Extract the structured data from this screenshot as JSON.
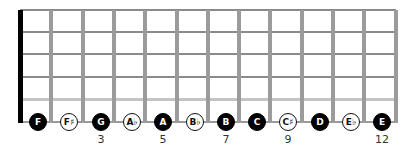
{
  "diagram": {
    "type": "guitar-fretboard",
    "strings": 6,
    "frets": 12,
    "colors": {
      "nut": "#000000",
      "fret": "#9b9b9b",
      "string": "#8a8a8a",
      "natural_note_fill": "#000000",
      "accidental_note_fill": "#ffffff"
    },
    "notes": [
      {
        "label": "F",
        "position": 1,
        "style": "filled"
      },
      {
        "label": "F♯",
        "position": 2,
        "style": "open"
      },
      {
        "label": "G",
        "position": 3,
        "style": "filled"
      },
      {
        "label": "A♭",
        "position": 4,
        "style": "open"
      },
      {
        "label": "A",
        "position": 5,
        "style": "filled"
      },
      {
        "label": "B♭",
        "position": 6,
        "style": "open"
      },
      {
        "label": "B",
        "position": 7,
        "style": "filled"
      },
      {
        "label": "C",
        "position": 8,
        "style": "filled"
      },
      {
        "label": "C♯",
        "position": 9,
        "style": "open"
      },
      {
        "label": "D",
        "position": 10,
        "style": "filled"
      },
      {
        "label": "E♭",
        "position": 11,
        "style": "open"
      },
      {
        "label": "E",
        "position": 12,
        "style": "filled"
      }
    ],
    "fret_markers": [
      {
        "label": "3",
        "position": 3
      },
      {
        "label": "5",
        "position": 5
      },
      {
        "label": "7",
        "position": 7
      },
      {
        "label": "9",
        "position": 9
      },
      {
        "label": "12",
        "position": 12
      }
    ]
  }
}
